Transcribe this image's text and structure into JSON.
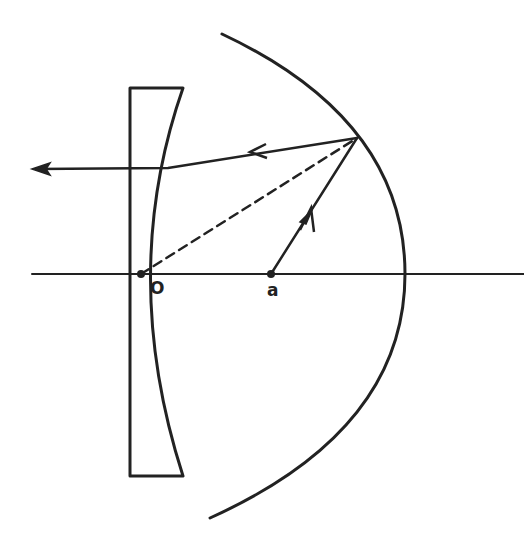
{
  "diagram": {
    "colors": {
      "stroke": "#222222",
      "background": "#ffffff"
    },
    "labels": {
      "origin": "O",
      "point_a": "a"
    },
    "points": {
      "O": [
        141,
        274
      ],
      "a": [
        271,
        274
      ],
      "reflection": [
        357,
        138
      ]
    },
    "elements": [
      {
        "name": "optical-axis",
        "type": "line"
      },
      {
        "name": "plano-concave-lens",
        "type": "lens"
      },
      {
        "name": "spherical-mirror",
        "type": "arc"
      },
      {
        "name": "ray-from-a",
        "type": "ray-with-arrow"
      },
      {
        "name": "reflected-ray",
        "type": "ray-with-arrow"
      },
      {
        "name": "dashed-radius",
        "type": "dashed-line"
      }
    ]
  }
}
